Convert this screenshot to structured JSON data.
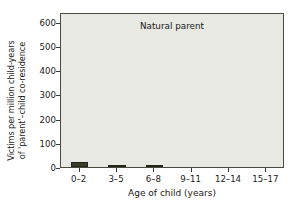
{
  "chart_data": {
    "type": "bar",
    "title": "Natural parent",
    "xlabel": "Age of child (years)",
    "ylabel_line1": "Victims per million child-years",
    "ylabel_line2": "of 'parent'–child co-residence",
    "categories": [
      "0–2",
      "3–5",
      "6–8",
      "9–11",
      "12–14",
      "15–17"
    ],
    "values": [
      20,
      10,
      9,
      0,
      0,
      0
    ],
    "ylim": [
      0,
      640
    ],
    "yticks": [
      0,
      100,
      200,
      300,
      400,
      500,
      600
    ],
    "ytick_labels": [
      "0",
      "100",
      "200",
      "300",
      "400",
      "500",
      "600"
    ],
    "grid": false,
    "legend": "none",
    "bar_color": "#3a3c28",
    "plot_background": "#e8e9e3",
    "axis_color": "#4a4a42",
    "page_background": "#ffffff"
  }
}
